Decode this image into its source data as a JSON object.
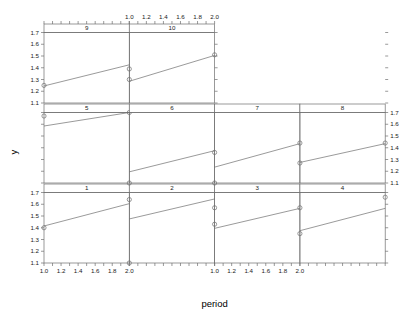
{
  "chart_data": {
    "type": "scatter",
    "title": "",
    "xlabel": "period",
    "ylabel": "y",
    "xlim": [
      1.0,
      2.0
    ],
    "ylim": [
      1.1,
      1.7
    ],
    "grid": false,
    "legend": false,
    "layout": {
      "rows": 3,
      "cols": 4,
      "panel_order": "bottom-left-to-top-right"
    },
    "x_ticks": [
      1.0,
      1.2,
      1.4,
      1.6,
      1.8,
      2.0
    ],
    "x_tick_labels": [
      "1.0",
      "1.2",
      "1.4",
      "1.6",
      "1.8",
      "2.0"
    ],
    "y_ticks": [
      1.1,
      1.2,
      1.3,
      1.4,
      1.5,
      1.6,
      1.7
    ],
    "y_tick_labels": [
      "1.1",
      "1.2",
      "1.3",
      "1.4",
      "1.5",
      "1.6",
      "1.7"
    ],
    "panels": [
      {
        "strip": "1",
        "row": 3,
        "col": 1,
        "x": [
          1.0,
          2.0
        ],
        "y": [
          1.4,
          1.64
        ],
        "line": [
          [
            1.0,
            1.415
          ],
          [
            2.0,
            1.605
          ]
        ]
      },
      {
        "strip": "2",
        "row": 3,
        "col": 2,
        "x": [
          1.0,
          2.0
        ],
        "y": [
          1.1,
          1.57
        ],
        "line": [
          [
            1.0,
            1.475
          ],
          [
            2.0,
            1.645
          ]
        ]
      },
      {
        "strip": "3",
        "row": 3,
        "col": 3,
        "x": [
          1.0,
          2.0
        ],
        "y": [
          1.43,
          1.57
        ],
        "line": [
          [
            1.0,
            1.395
          ],
          [
            2.0,
            1.565
          ]
        ]
      },
      {
        "strip": "4",
        "row": 3,
        "col": 4,
        "x": [
          1.0,
          2.0
        ],
        "y": [
          1.35,
          1.66
        ],
        "line": [
          [
            1.0,
            1.375
          ],
          [
            2.0,
            1.565
          ]
        ]
      },
      {
        "strip": "5",
        "row": 2,
        "col": 1,
        "x": [
          1.0,
          2.0
        ],
        "y": [
          1.67,
          1.7
        ],
        "line": [
          [
            1.0,
            1.585
          ],
          [
            2.0,
            1.715
          ]
        ]
      },
      {
        "strip": "6",
        "row": 2,
        "col": 2,
        "x": [
          1.0,
          2.0
        ],
        "y": [
          1.1,
          1.36
        ],
        "line": [
          [
            1.0,
            1.195
          ],
          [
            2.0,
            1.375
          ]
        ]
      },
      {
        "strip": "7",
        "row": 2,
        "col": 3,
        "x": [
          1.0,
          2.0
        ],
        "y": [
          1.1,
          1.44
        ],
        "line": [
          [
            1.0,
            1.235
          ],
          [
            2.0,
            1.435
          ]
        ]
      },
      {
        "strip": "8",
        "row": 2,
        "col": 4,
        "x": [
          1.0,
          2.0
        ],
        "y": [
          1.27,
          1.44
        ],
        "line": [
          [
            1.0,
            1.275
          ],
          [
            2.0,
            1.435
          ]
        ]
      },
      {
        "strip": "9",
        "row": 1,
        "col": 1,
        "x": [
          1.0,
          2.0
        ],
        "y": [
          1.25,
          1.39
        ],
        "line": [
          [
            1.0,
            1.245
          ],
          [
            2.0,
            1.425
          ]
        ]
      },
      {
        "strip": "10",
        "row": 1,
        "col": 2,
        "x": [
          1.0,
          2.0
        ],
        "y": [
          1.3,
          1.51
        ],
        "line": [
          [
            1.0,
            1.285
          ],
          [
            2.0,
            1.505
          ]
        ]
      }
    ]
  },
  "axes": {
    "x_title": "period",
    "y_title": "y"
  }
}
